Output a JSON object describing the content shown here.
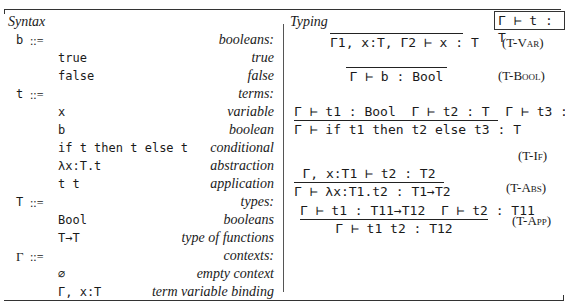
{
  "syntax": {
    "title": "Syntax",
    "definitions": [
      {
        "nonterminal": "b",
        "def": "::=",
        "description": "booleans:"
      },
      {
        "form": "true",
        "description": "true"
      },
      {
        "form": "false",
        "description": "false"
      },
      {
        "nonterminal": "t",
        "def": "::=",
        "description": "terms:"
      },
      {
        "form": "x",
        "description": "variable"
      },
      {
        "form": "b",
        "description": "boolean"
      },
      {
        "form": "if t then t else t",
        "description": "conditional"
      },
      {
        "form": "λx:T.t",
        "description": "abstraction"
      },
      {
        "form": "t t",
        "description": "application"
      },
      {
        "nonterminal": "T",
        "def": "::=",
        "description": "types:"
      },
      {
        "form": "Bool",
        "description": "booleans"
      },
      {
        "form": "T→T",
        "description": "type of functions"
      },
      {
        "nonterminal": "Γ",
        "def": "::=",
        "description": "contexts:"
      },
      {
        "form": "∅",
        "description": "empty context"
      },
      {
        "form": "Γ, x:T",
        "description": "term variable binding"
      }
    ]
  },
  "typing": {
    "title": "Typing",
    "judgment": "Γ ⊢ t : T",
    "rules": [
      {
        "name": "T-Var",
        "premises": [],
        "conclusion": "Γ1, x:T, Γ2 ⊢ x : T"
      },
      {
        "name": "T-Bool",
        "premises": [],
        "conclusion": "Γ ⊢ b : Bool"
      },
      {
        "name": "T-If",
        "premises": [
          "Γ ⊢ t1 : Bool",
          "Γ ⊢ t2 : T",
          "Γ ⊢ t3 : T"
        ],
        "conclusion": "Γ ⊢ if t1 then t2 else t3 : T"
      },
      {
        "name": "T-Abs",
        "premises": [
          "Γ, x:T1 ⊢ t2 : T2"
        ],
        "conclusion": "Γ ⊢ λx:T1.t2 : T1→T2"
      },
      {
        "name": "T-App",
        "premises": [
          "Γ ⊢ t1 : T11→T12",
          "Γ ⊢ t2 : T11"
        ],
        "conclusion": "Γ ⊢ t1 t2 : T12"
      }
    ]
  }
}
